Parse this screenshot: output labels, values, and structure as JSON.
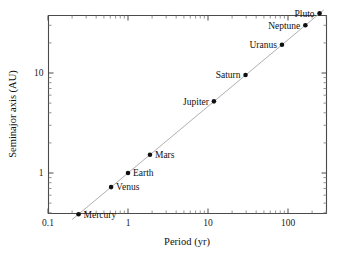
{
  "chart_data": {
    "type": "scatter",
    "title": "",
    "xlabel": "Period (yr)",
    "ylabel": "Seminajor axis (AU)",
    "xscale": "log",
    "yscale": "log",
    "xlim": [
      0.1,
      350
    ],
    "ylim": [
      0.3,
      55
    ],
    "grid": false,
    "legend": "none",
    "x_tick_labels": [
      "0.1",
      "1",
      "10",
      "100"
    ],
    "x_tick_values": [
      0.1,
      1,
      10,
      100
    ],
    "y_tick_labels": [
      "1",
      "10"
    ],
    "y_tick_values": [
      1,
      10
    ],
    "series": [
      {
        "name": "Planets",
        "marker": "filled-circle",
        "marker_color": "#101010",
        "points": [
          {
            "label": "Mercury",
            "period_yr": 0.241,
            "semimajor_au": 0.387,
            "label_side": "right"
          },
          {
            "label": "Venus",
            "period_yr": 0.615,
            "semimajor_au": 0.723,
            "label_side": "right"
          },
          {
            "label": "Earth",
            "period_yr": 1.0,
            "semimajor_au": 1.0,
            "label_side": "right"
          },
          {
            "label": "Mars",
            "period_yr": 1.881,
            "semimajor_au": 1.524,
            "label_side": "right"
          },
          {
            "label": "Jupiter",
            "period_yr": 11.86,
            "semimajor_au": 5.203,
            "label_side": "left"
          },
          {
            "label": "Saturn",
            "period_yr": 29.46,
            "semimajor_au": 9.537,
            "label_side": "left"
          },
          {
            "label": "Uranus",
            "period_yr": 84.01,
            "semimajor_au": 19.19,
            "label_side": "left"
          },
          {
            "label": "Neptune",
            "period_yr": 164.8,
            "semimajor_au": 30.07,
            "label_side": "left"
          },
          {
            "label": "Pluto",
            "period_yr": 248.1,
            "semimajor_au": 39.48,
            "label_side": "left"
          }
        ]
      },
      {
        "name": "Kepler third law fit",
        "type": "line",
        "line_color": "#b0b0b0",
        "relation": "a = P^(2/3)",
        "endpoints": [
          {
            "period_yr": 0.2,
            "semimajor_au": 0.342
          },
          {
            "period_yr": 280,
            "semimajor_au": 42.7
          }
        ]
      }
    ]
  },
  "axes": {
    "x_title": "Period (yr)",
    "y_title": "Seminajor axis (AU)",
    "x_ticks": [
      "0.1",
      "1",
      "10",
      "100"
    ],
    "y_ticks": [
      "1",
      "10"
    ]
  },
  "colors": {
    "background": "#ffffff",
    "axis": "#4a4a4a",
    "marker": "#101010",
    "fit_line": "#b0b0b0",
    "text": "#111111"
  }
}
